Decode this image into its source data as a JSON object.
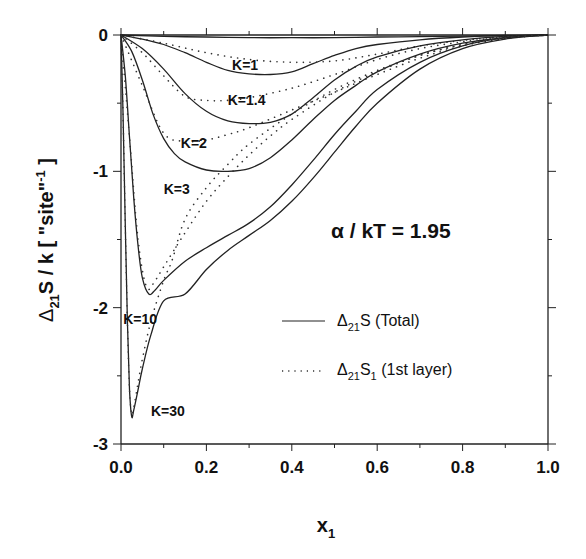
{
  "chart_data": {
    "type": "line",
    "title": "",
    "xlabel": "x1",
    "xlabel_main": "x",
    "xlabel_sub": "1",
    "ylabel": "Δ21S / k [\"site\"-1]",
    "ylabel_parts": {
      "delta": "Δ",
      "sub": "21",
      "main": "S / k  [ \"site\"",
      "sup": "-1",
      "close": " ]"
    },
    "xlim": [
      0.0,
      1.0
    ],
    "ylim": [
      -3,
      0
    ],
    "x_ticks": [
      "0.0",
      "0.2",
      "0.4",
      "0.6",
      "0.8",
      "1.0"
    ],
    "y_ticks": [
      "0",
      "-1",
      "-2",
      "-3"
    ],
    "grid": false,
    "annotation": "α / kT = 1.95",
    "legend": {
      "position": "lower right",
      "entries": [
        {
          "style": "solid",
          "label_main": "Δ",
          "label_sub": "21",
          "label_rest": "S (Total)",
          "label": "Δ21S (Total)"
        },
        {
          "style": "dotted",
          "label_main": "Δ",
          "label_sub": "21",
          "label_rest": "S",
          "label_sub2": "1",
          "label_tail": " (1st layer)",
          "label": "Δ21S1 (1st layer)"
        }
      ]
    },
    "series": [
      {
        "name": "K=1 total",
        "K": "K=1",
        "style": "solid",
        "x": [
          0,
          0.1,
          0.2,
          0.3,
          0.4,
          0.5,
          0.6,
          0.7,
          0.8,
          0.9,
          1.0
        ],
        "y": [
          0,
          -0.01,
          -0.015,
          -0.02,
          -0.02,
          -0.02,
          -0.015,
          -0.012,
          -0.008,
          -0.004,
          0
        ]
      },
      {
        "name": "K=1.4 total",
        "K": "K=1.4",
        "style": "solid",
        "x": [
          0,
          0.05,
          0.1,
          0.15,
          0.2,
          0.25,
          0.3,
          0.35,
          0.4,
          0.45,
          0.5,
          0.55,
          0.6,
          0.7,
          0.8,
          0.9,
          1.0
        ],
        "y": [
          0,
          -0.03,
          -0.07,
          -0.13,
          -0.2,
          -0.26,
          -0.285,
          -0.29,
          -0.27,
          -0.21,
          -0.15,
          -0.1,
          -0.07,
          -0.035,
          -0.015,
          -0.005,
          0
        ]
      },
      {
        "name": "K=1.4 1st layer",
        "K": "K=1.4",
        "style": "dotted",
        "x": [
          0,
          0.1,
          0.2,
          0.3,
          0.4,
          0.5,
          0.6,
          0.7,
          0.8,
          0.9,
          1.0
        ],
        "y": [
          0,
          -0.06,
          -0.13,
          -0.18,
          -0.2,
          -0.19,
          -0.14,
          -0.08,
          -0.04,
          -0.01,
          0
        ]
      },
      {
        "name": "K=2 total",
        "K": "K=2",
        "style": "solid",
        "x": [
          0,
          0.05,
          0.1,
          0.15,
          0.2,
          0.25,
          0.3,
          0.35,
          0.4,
          0.45,
          0.5,
          0.55,
          0.6,
          0.7,
          0.8,
          0.9,
          1.0
        ],
        "y": [
          0,
          -0.1,
          -0.25,
          -0.43,
          -0.56,
          -0.63,
          -0.65,
          -0.64,
          -0.58,
          -0.46,
          -0.33,
          -0.23,
          -0.16,
          -0.08,
          -0.035,
          -0.01,
          0
        ]
      },
      {
        "name": "K=2 1st layer",
        "K": "K=2",
        "style": "dotted",
        "x": [
          0,
          0.05,
          0.1,
          0.15,
          0.2,
          0.25,
          0.3,
          0.4,
          0.5,
          0.6,
          0.7,
          0.8,
          0.9,
          1.0
        ],
        "y": [
          0,
          -0.13,
          -0.3,
          -0.45,
          -0.48,
          -0.48,
          -0.46,
          -0.39,
          -0.29,
          -0.18,
          -0.1,
          -0.05,
          -0.015,
          0
        ]
      },
      {
        "name": "K=3 total",
        "K": "K=3",
        "style": "solid",
        "x": [
          0,
          0.025,
          0.05,
          0.075,
          0.1,
          0.125,
          0.15,
          0.2,
          0.25,
          0.3,
          0.35,
          0.4,
          0.45,
          0.5,
          0.55,
          0.6,
          0.7,
          0.8,
          0.9,
          1.0
        ],
        "y": [
          0,
          -0.12,
          -0.33,
          -0.58,
          -0.76,
          -0.87,
          -0.93,
          -0.99,
          -1.0,
          -0.98,
          -0.9,
          -0.77,
          -0.62,
          -0.48,
          -0.37,
          -0.27,
          -0.14,
          -0.06,
          -0.02,
          0
        ]
      },
      {
        "name": "K=3 1st layer",
        "K": "K=3",
        "style": "dotted",
        "x": [
          0,
          0.05,
          0.1,
          0.15,
          0.2,
          0.25,
          0.3,
          0.4,
          0.5,
          0.6,
          0.7,
          0.8,
          0.9,
          1.0
        ],
        "y": [
          0,
          -0.37,
          -0.72,
          -0.78,
          -0.77,
          -0.73,
          -0.68,
          -0.55,
          -0.42,
          -0.29,
          -0.17,
          -0.08,
          -0.025,
          0
        ]
      },
      {
        "name": "K=10 total",
        "K": "K=10",
        "style": "solid",
        "x": [
          0,
          0.01,
          0.02,
          0.03,
          0.04,
          0.05,
          0.065,
          0.08,
          0.1,
          0.15,
          0.2,
          0.25,
          0.3,
          0.35,
          0.4,
          0.45,
          0.5,
          0.55,
          0.6,
          0.7,
          0.8,
          0.9,
          1.0
        ],
        "y": [
          0,
          -0.3,
          -0.75,
          -1.2,
          -1.55,
          -1.78,
          -1.9,
          -1.87,
          -1.8,
          -1.66,
          -1.56,
          -1.47,
          -1.38,
          -1.26,
          -1.1,
          -0.92,
          -0.73,
          -0.56,
          -0.4,
          -0.2,
          -0.08,
          -0.02,
          0
        ]
      },
      {
        "name": "K=10 1st layer",
        "K": "K=10",
        "style": "dotted",
        "x": [
          0,
          0.02,
          0.04,
          0.06,
          0.08,
          0.1,
          0.15,
          0.2,
          0.25,
          0.3,
          0.35,
          0.4,
          0.5,
          0.6,
          0.7,
          0.8,
          0.9,
          1.0
        ],
        "y": [
          0,
          -0.75,
          -1.5,
          -1.85,
          -1.8,
          -1.7,
          -1.45,
          -1.22,
          -1.04,
          -0.88,
          -0.74,
          -0.62,
          -0.42,
          -0.27,
          -0.15,
          -0.07,
          -0.02,
          0
        ]
      },
      {
        "name": "K=30 total",
        "K": "K=30",
        "style": "solid",
        "x": [
          0,
          0.005,
          0.01,
          0.015,
          0.02,
          0.025,
          0.03,
          0.04,
          0.05,
          0.07,
          0.1,
          0.15,
          0.2,
          0.25,
          0.3,
          0.35,
          0.4,
          0.45,
          0.5,
          0.55,
          0.6,
          0.7,
          0.8,
          0.9,
          1.0
        ],
        "y": [
          0,
          -0.6,
          -1.4,
          -2.1,
          -2.6,
          -2.8,
          -2.75,
          -2.6,
          -2.45,
          -2.2,
          -1.95,
          -1.9,
          -1.72,
          -1.58,
          -1.47,
          -1.36,
          -1.22,
          -1.05,
          -0.86,
          -0.67,
          -0.5,
          -0.25,
          -0.1,
          -0.03,
          0
        ]
      },
      {
        "name": "K=30 1st layer",
        "K": "K=30",
        "style": "dotted",
        "x": [
          0,
          0.005,
          0.01,
          0.015,
          0.02,
          0.025,
          0.03,
          0.04,
          0.05,
          0.07,
          0.1,
          0.12,
          0.15,
          0.2,
          0.25,
          0.3,
          0.4,
          0.5,
          0.6,
          0.7,
          0.8,
          0.9,
          1.0
        ],
        "y": [
          0,
          -0.6,
          -1.4,
          -2.1,
          -2.6,
          -2.78,
          -2.73,
          -2.55,
          -2.38,
          -2.1,
          -1.8,
          -1.65,
          -1.35,
          -1.12,
          -0.95,
          -0.8,
          -0.58,
          -0.4,
          -0.26,
          -0.15,
          -0.07,
          -0.02,
          0
        ]
      }
    ],
    "curve_labels": [
      {
        "text": "K=1",
        "x": 0.26,
        "y": -0.22
      },
      {
        "text": "K=1.4",
        "x": 0.25,
        "y": -0.48
      },
      {
        "text": "K=2",
        "x": 0.14,
        "y": -0.79
      },
      {
        "text": "K=3",
        "x": 0.1,
        "y": -1.13
      },
      {
        "text": "K=10",
        "x": 0.005,
        "y": -2.08
      },
      {
        "text": "K=30",
        "x": 0.07,
        "y": -2.76
      }
    ]
  }
}
